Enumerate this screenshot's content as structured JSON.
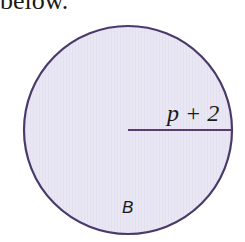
{
  "caption": {
    "text": "below."
  },
  "figure": {
    "circle": {
      "cx": 128,
      "cy": 130,
      "r": 104,
      "fill": "#e7e6f2",
      "stroke": "#4a3a6a"
    },
    "radius": {
      "x1": 128,
      "y1": 130,
      "x2": 232,
      "y2": 130,
      "stroke": "#5a3d6e",
      "label": "p + 2"
    },
    "label": "B"
  }
}
